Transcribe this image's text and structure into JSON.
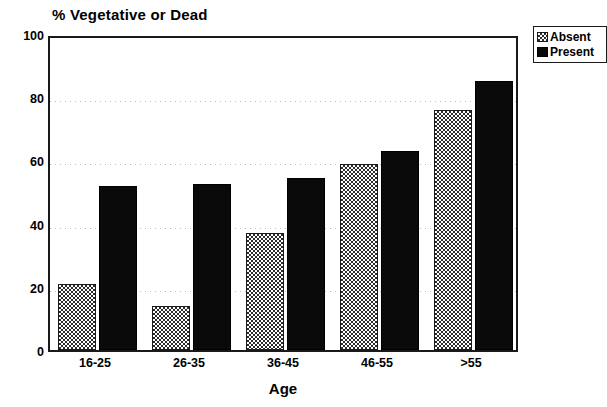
{
  "chart_data": {
    "type": "bar",
    "title": "% Vegetative or Dead",
    "xlabel": "Age",
    "ylabel": "",
    "categories": [
      "16-25",
      "26-35",
      "36-45",
      "46-55",
      ">55"
    ],
    "series": [
      {
        "name": "Absent",
        "values": [
          21,
          14,
          37,
          59,
          76
        ]
      },
      {
        "name": "Present",
        "values": [
          52,
          52.5,
          54.5,
          63,
          85
        ]
      }
    ],
    "ylim": [
      0,
      100
    ],
    "yticks": [
      0,
      20,
      40,
      60,
      80,
      100
    ],
    "ytick_labels": [
      "0",
      "20",
      "40",
      "60",
      "80",
      "100"
    ],
    "grid": true,
    "grid_axis": "y",
    "legend_position": "outside-top-right",
    "colors": {
      "absent_fill": "#ffffff",
      "absent_hatch": "#2b2b2b",
      "present_fill": "#0a0a0a",
      "axis": "#1a1a1a",
      "gridline": "#bdbdbd",
      "background": "#ffffff"
    }
  },
  "legend": {
    "entries": [
      {
        "label": "Absent",
        "swatch": "crosshatch-swatch"
      },
      {
        "label": "Present",
        "swatch": "solid-black-swatch"
      }
    ]
  }
}
